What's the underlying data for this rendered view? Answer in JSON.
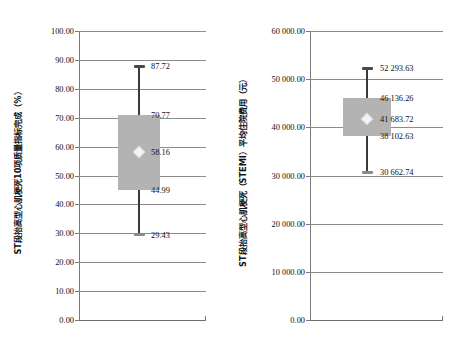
{
  "chart_data": [
    {
      "id": "left",
      "type": "box",
      "title": "",
      "xlabel": "",
      "ylabel": "ST段抬高型心肌梗死10项质量指标完成（%）",
      "ylim": [
        0,
        100
      ],
      "ytick_labels": [
        "100.00",
        "90.00",
        "80.00",
        "70.00",
        "60.00",
        "50.00",
        "40.00",
        "30.00",
        "20.00",
        "10.00",
        "0.00"
      ],
      "ytick_values": [
        100,
        90,
        80,
        70,
        60,
        50,
        40,
        30,
        20,
        10,
        0
      ],
      "grid": true,
      "legend": "none",
      "box": {
        "max": 87.72,
        "q3": 70.77,
        "mean": 58.16,
        "q1": 44.99,
        "min": 29.43
      },
      "labels": {
        "max": "87.72",
        "q3": "70.77",
        "mean": "58.16",
        "q1": "44.99",
        "min": "29.43"
      }
    },
    {
      "id": "right",
      "type": "box",
      "title": "",
      "xlabel": "",
      "ylabel": "ST段抬高型心肌梗死（STEMI）平均住院费用（元）",
      "ylim": [
        0,
        60000
      ],
      "ytick_labels": [
        "60 000.00",
        "50 000.00",
        "40 000.00",
        "30 000.00",
        "20 000.00",
        "10 000.00",
        "0.00"
      ],
      "ytick_values": [
        60000,
        50000,
        40000,
        30000,
        20000,
        10000,
        0
      ],
      "grid": true,
      "legend": "none",
      "box": {
        "max": 52293.63,
        "q3": 46136.26,
        "mean": 41683.72,
        "q1": 38102.63,
        "min": 30662.74
      },
      "labels": {
        "max": "52 293.63",
        "q3": "46 136.26",
        "mean": "41 683.72",
        "q1": "38 102.63",
        "min": "30 662.74"
      }
    }
  ],
  "colors": {
    "box_fill": "#b3b3b3",
    "whisker": "#3a3a3a",
    "gridline": "#8c8c8c",
    "axis": "#7a7a7a",
    "mean_marker": "#f4f4f4",
    "text": "#111111",
    "background": "#ffffff"
  }
}
